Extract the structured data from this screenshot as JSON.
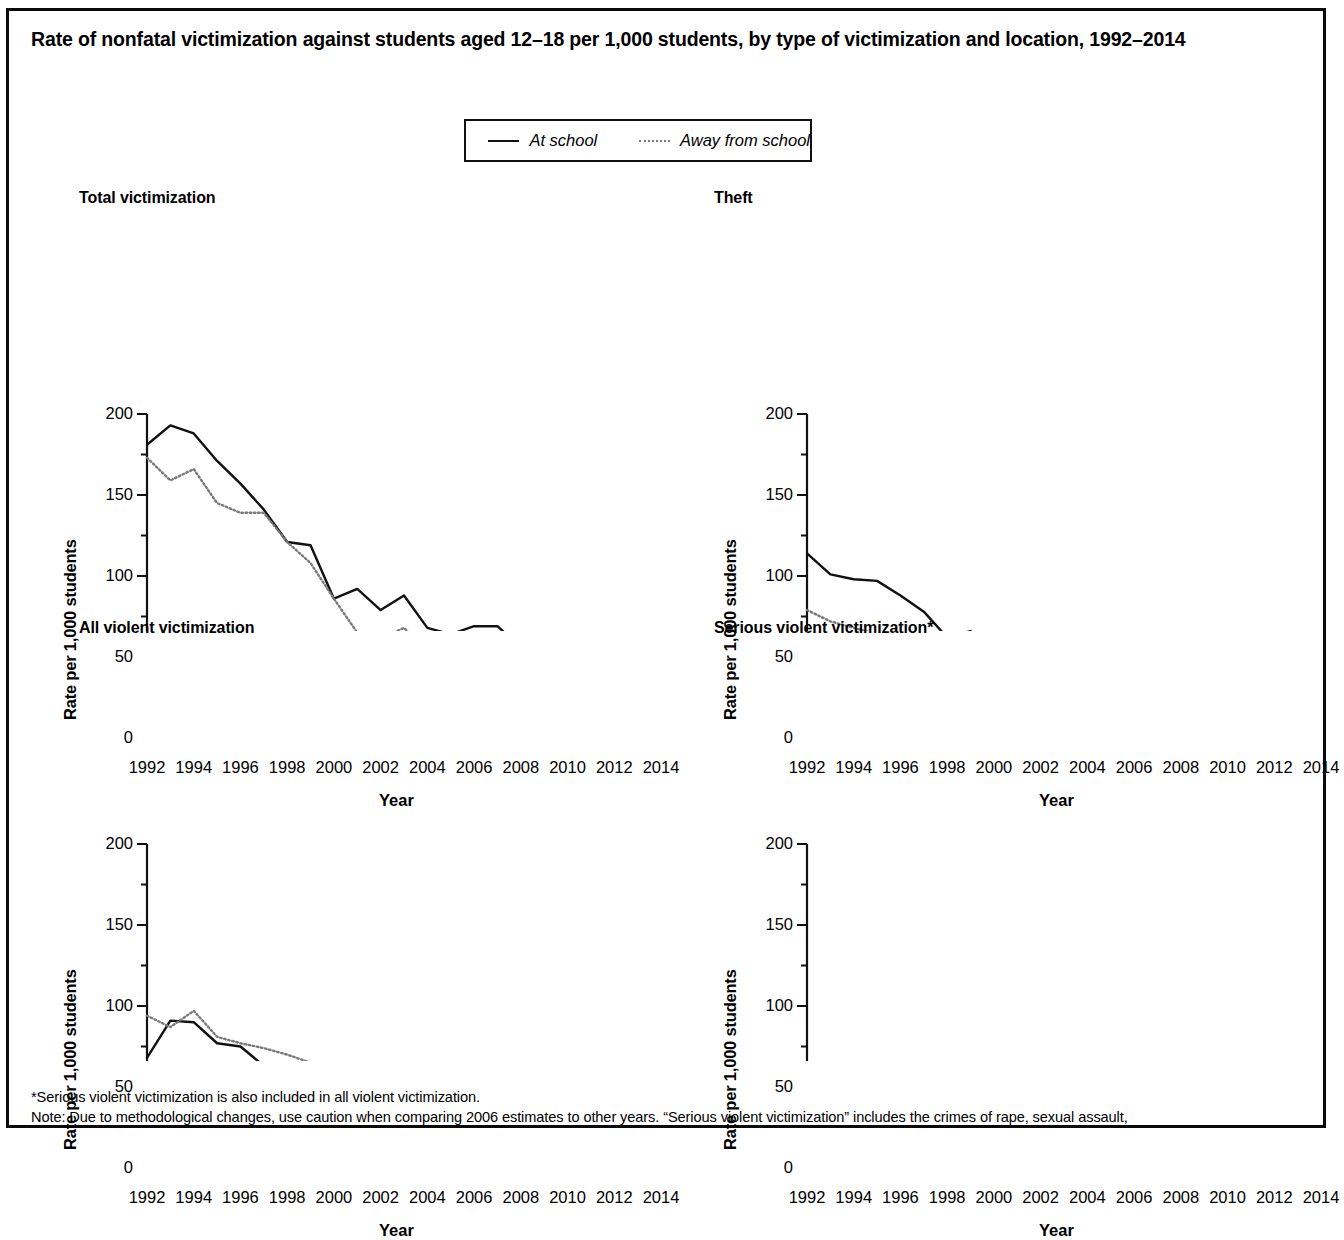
{
  "figure": {
    "title": "Rate of nonfatal victimization against students aged 12–18 per 1,000 students, by type of victimization and location, 1992–2014"
  },
  "legend": {
    "at_school_label": "At school",
    "away_from_school_label": "Away from school",
    "at_school_color": "#111111",
    "away_from_school_color": "#7a7a7a"
  },
  "footnotes": {
    "line1": "*Serious violent victimization is also included in all violent victimization.",
    "line2": "Note: Due to methodological changes, use caution when comparing 2006 estimates to other years. “Serious violent victimization” includes the crimes of rape, sexual assault,"
  },
  "axes": {
    "ylabel": "Rate per 1,000 students",
    "xlabel": "Year",
    "yticks": [
      "0",
      "50",
      "100",
      "150",
      "200"
    ],
    "xticks": [
      "1992",
      "1994",
      "1996",
      "1998",
      "2000",
      "2002",
      "2004",
      "2006",
      "2008",
      "2010",
      "2012",
      "2014"
    ]
  },
  "chart_data": [
    {
      "type": "line",
      "title": "Total victimization",
      "xlabel": "Year",
      "ylabel": "Rate per 1,000 students",
      "xlim": [
        1992,
        2014
      ],
      "ylim": [
        0,
        200
      ],
      "grid": false,
      "legend_position": "top-center-shared",
      "x": [
        1992,
        1993,
        1994,
        1995,
        1996,
        1997,
        1998,
        1999,
        2000,
        2001,
        2002,
        2003,
        2004,
        2005,
        2006,
        2007,
        2008,
        2009,
        2010,
        2011,
        2012,
        2013,
        2014
      ],
      "series": [
        {
          "name": "At school",
          "values": [
            181,
            193,
            188,
            171,
            157,
            141,
            121,
            119,
            86,
            92,
            79,
            88,
            68,
            64,
            69,
            69,
            56,
            53,
            37,
            51,
            53,
            57,
            35
          ]
        },
        {
          "name": "Away from school",
          "values": [
            173,
            159,
            166,
            145,
            139,
            139,
            121,
            108,
            86,
            65,
            61,
            68,
            54,
            55,
            53,
            53,
            44,
            35,
            27,
            38,
            38,
            32,
            25
          ]
        }
      ]
    },
    {
      "type": "line",
      "title": "Theft",
      "xlabel": "Year",
      "ylabel": "Rate per 1,000 students",
      "xlim": [
        1992,
        2014
      ],
      "ylim": [
        0,
        200
      ],
      "grid": false,
      "legend_position": "top-center-shared",
      "x": [
        1992,
        1993,
        1994,
        1995,
        1996,
        1997,
        1998,
        1999,
        2000,
        2001,
        2002,
        2003,
        2004,
        2005,
        2006,
        2007,
        2008,
        2009,
        2010,
        2011,
        2012,
        2013,
        2014
      ],
      "series": [
        {
          "name": "At school",
          "values": [
            114,
            101,
            98,
            97,
            88,
            78,
            62,
            66,
            50,
            50,
            40,
            49,
            44,
            34,
            33,
            35,
            26,
            24,
            19,
            26,
            24,
            20,
            15
          ]
        },
        {
          "name": "Away from school",
          "values": [
            79,
            72,
            68,
            64,
            61,
            65,
            51,
            43,
            45,
            36,
            31,
            30,
            28,
            25,
            28,
            24,
            20,
            19,
            16,
            21,
            19,
            17,
            13
          ]
        }
      ]
    },
    {
      "type": "line",
      "title": "All violent victimization",
      "xlabel": "Year",
      "ylabel": "Rate per 1,000 students",
      "xlim": [
        1992,
        2014
      ],
      "ylim": [
        0,
        200
      ],
      "grid": false,
      "legend_position": "top-center-shared",
      "x": [
        1992,
        1993,
        1994,
        1995,
        1996,
        1997,
        1998,
        1999,
        2000,
        2001,
        2002,
        2003,
        2004,
        2005,
        2006,
        2007,
        2008,
        2009,
        2010,
        2011,
        2012,
        2013,
        2014
      ],
      "series": [
        {
          "name": "At school",
          "values": [
            68,
            91,
            90,
            77,
            75,
            63,
            59,
            53,
            38,
            44,
            39,
            41,
            28,
            31,
            36,
            35,
            31,
            30,
            19,
            25,
            31,
            39,
            21
          ]
        },
        {
          "name": "Away from school",
          "values": [
            94,
            87,
            97,
            81,
            77,
            74,
            70,
            65,
            37,
            31,
            30,
            38,
            27,
            31,
            28,
            29,
            24,
            16,
            14,
            18,
            20,
            16,
            15
          ]
        }
      ]
    },
    {
      "type": "line",
      "title": "Serious violent victimization*",
      "xlabel": "Year",
      "ylabel": "Rate per 1,000 students",
      "xlim": [
        1992,
        2014
      ],
      "ylim": [
        0,
        200
      ],
      "grid": false,
      "legend_position": "top-center-shared",
      "x": [
        1992,
        1993,
        1994,
        1995,
        1996,
        1997,
        1998,
        1999,
        2000,
        2001,
        2002,
        2003,
        2004,
        2005,
        2006,
        2007,
        2008,
        2009,
        2010,
        2011,
        2012,
        2013,
        2014
      ],
      "series": [
        {
          "name": "At school",
          "values": [
            8,
            22,
            19,
            13,
            15,
            15,
            13,
            11,
            9,
            12,
            7,
            9,
            5,
            7,
            11,
            5,
            8,
            12,
            8,
            6,
            4,
            7,
            6
          ]
        },
        {
          "name": "Away from school",
          "values": [
            43,
            41,
            43,
            33,
            34,
            34,
            30,
            26,
            17,
            14,
            13,
            17,
            13,
            12,
            12,
            16,
            11,
            11,
            9,
            8,
            8,
            9,
            8
          ]
        }
      ]
    }
  ]
}
